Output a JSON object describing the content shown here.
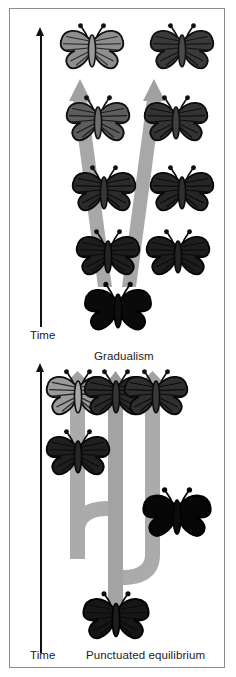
{
  "figure": {
    "background_color": "#ffffff",
    "frame_color": "#8b8b8b",
    "arrow_color": "#9a9a9a",
    "arrow_color_light": "#b4b4b4",
    "text_color": "#1b1b1b",
    "width": 236,
    "height": 677
  },
  "panels": [
    {
      "id": "gradualism",
      "caption": "Gradualism",
      "axis_label": "Time",
      "axis_direction": "up",
      "description": "A single dark ancestral butterfly at the bottom whose lineage splits into two gradually diverging branches; each branch lightens step by step over five successive stages.",
      "organisms": [
        {
          "stage": 5,
          "branch": "left",
          "shade": "light",
          "fill": "#8e8e8e"
        },
        {
          "stage": 5,
          "branch": "right",
          "shade": "dark",
          "fill": "#3a3a3a"
        },
        {
          "stage": 4,
          "branch": "left",
          "shade": "medium",
          "fill": "#5d5d5d"
        },
        {
          "stage": 4,
          "branch": "right",
          "shade": "dark",
          "fill": "#333333"
        },
        {
          "stage": 3,
          "branch": "left",
          "shade": "dark",
          "fill": "#2b2b2b"
        },
        {
          "stage": 3,
          "branch": "right",
          "shade": "dark",
          "fill": "#262626"
        },
        {
          "stage": 2,
          "branch": "left",
          "shade": "very-dark",
          "fill": "#1d1d1d"
        },
        {
          "stage": 2,
          "branch": "right",
          "shade": "very-dark",
          "fill": "#1d1d1d"
        },
        {
          "stage": 1,
          "branch": "stem",
          "shade": "black",
          "fill": "#0a0a0a"
        }
      ]
    },
    {
      "id": "punctuated",
      "caption": "Punctuated equilibrium",
      "axis_label": "Time",
      "axis_direction": "up",
      "description": "A black ancestral butterfly at the bottom; lineages remain unchanged along long horizontal stasis segments, then change abruptly in short vertical bursts, producing three distinct descendant forms at the top.",
      "organisms": [
        {
          "stage": "descendant",
          "position": "left",
          "shade": "light",
          "fill": "#9b9b9b"
        },
        {
          "stage": "descendant",
          "position": "middle",
          "shade": "dark",
          "fill": "#2a2a2a"
        },
        {
          "stage": "descendant",
          "position": "right",
          "shade": "dark",
          "fill": "#2f2f2f"
        },
        {
          "stage": "intermediate",
          "position": "left",
          "shade": "very-dark",
          "fill": "#1f1f1f"
        },
        {
          "stage": "intermediate",
          "position": "right",
          "shade": "black",
          "fill": "#060606"
        },
        {
          "stage": "ancestor",
          "position": "bottom",
          "shade": "very-dark",
          "fill": "#161616"
        }
      ]
    }
  ]
}
